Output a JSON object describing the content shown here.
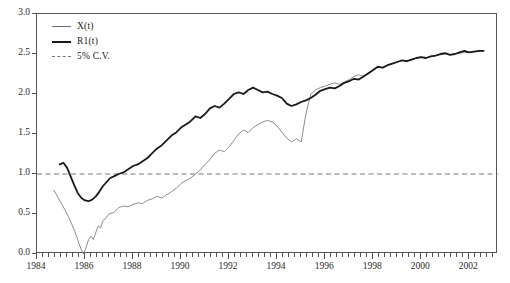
{
  "chart_data": {
    "type": "line",
    "title": "",
    "subtitle": "",
    "xlabel": "",
    "ylabel": "",
    "xlim": [
      1984.0,
      2003.2
    ],
    "ylim": [
      0.0,
      3.0
    ],
    "grid": false,
    "legend_position": "top-left",
    "x_ticks": [
      "1984",
      "1986",
      "1988",
      "1990",
      "1992",
      "1994",
      "1996",
      "1998",
      "2000",
      "2002"
    ],
    "x_tick_values": [
      1984,
      1986,
      1988,
      1990,
      1992,
      1994,
      1996,
      1998,
      2000,
      2002
    ],
    "x_minor_step": 0.25,
    "y_ticks": [
      "0.0",
      "0.5",
      "1.0",
      "1.5",
      "2.0",
      "2.5",
      "3.0"
    ],
    "y_tick_values": [
      0.0,
      0.5,
      1.0,
      1.5,
      2.0,
      2.5,
      3.0
    ],
    "colors": {
      "x_series": "#6e6e6e",
      "r1_series": "#1a1a1a",
      "critical_value": "#777777",
      "axis": "#555555",
      "background": "#ffffff"
    },
    "annotations": {
      "critical_value_level": 1.0
    },
    "series": [
      {
        "name": "X(t)",
        "style": "thin-solid",
        "color": "#6e6e6e",
        "linewidth": 0.8,
        "x": [
          1984.7,
          1984.85,
          1985.0,
          1985.15,
          1985.3,
          1985.45,
          1985.55,
          1985.65,
          1985.75,
          1985.85,
          1985.95,
          1986.05,
          1986.15,
          1986.25,
          1986.35,
          1986.45,
          1986.55,
          1986.65,
          1986.75,
          1986.85,
          1987.0,
          1987.2,
          1987.4,
          1987.6,
          1987.8,
          1988.0,
          1988.2,
          1988.4,
          1988.6,
          1988.8,
          1989.0,
          1989.2,
          1989.4,
          1989.6,
          1989.8,
          1990.0,
          1990.2,
          1990.4,
          1990.6,
          1990.8,
          1991.0,
          1991.2,
          1991.4,
          1991.6,
          1991.8,
          1992.0,
          1992.2,
          1992.4,
          1992.6,
          1992.8,
          1993.0,
          1993.2,
          1993.4,
          1993.6,
          1993.8,
          1994.0,
          1994.2,
          1994.4,
          1994.6,
          1994.8,
          1995.0,
          1995.2,
          1995.4,
          1995.6,
          1995.8,
          1996.0,
          1996.2,
          1996.4,
          1996.6,
          1996.8,
          1997.0,
          1997.2,
          1997.4,
          1997.6,
          1997.8,
          1998.0,
          1998.2,
          1998.4,
          1998.6,
          1998.8,
          1999.0,
          1999.2,
          1999.4,
          1999.6,
          1999.8,
          2000.0,
          2000.2,
          2000.4,
          2000.6,
          2000.8,
          2001.0,
          2001.2,
          2001.4,
          2001.6,
          2001.8,
          2002.0,
          2002.2,
          2002.4,
          2002.6
        ],
        "y": [
          0.8,
          0.72,
          0.64,
          0.56,
          0.47,
          0.37,
          0.3,
          0.22,
          0.13,
          0.05,
          0.0,
          0.09,
          0.18,
          0.22,
          0.18,
          0.27,
          0.35,
          0.33,
          0.42,
          0.44,
          0.5,
          0.52,
          0.58,
          0.6,
          0.59,
          0.62,
          0.64,
          0.63,
          0.67,
          0.69,
          0.72,
          0.7,
          0.74,
          0.78,
          0.82,
          0.88,
          0.92,
          0.95,
          1.0,
          1.05,
          1.12,
          1.18,
          1.26,
          1.3,
          1.28,
          1.34,
          1.42,
          1.5,
          1.55,
          1.52,
          1.58,
          1.62,
          1.65,
          1.67,
          1.65,
          1.6,
          1.52,
          1.45,
          1.4,
          1.44,
          1.4,
          1.75,
          2.0,
          2.05,
          2.08,
          2.1,
          2.12,
          2.14,
          2.12,
          2.15,
          2.18,
          2.22,
          2.24,
          2.22,
          2.25,
          2.3,
          2.35,
          2.33,
          2.36,
          2.38,
          2.4,
          2.42,
          2.41,
          2.43,
          2.45,
          2.46,
          2.45,
          2.47,
          2.48,
          2.49,
          2.5,
          2.49,
          2.5,
          2.51,
          2.52,
          2.52,
          2.53,
          2.53,
          2.54
        ]
      },
      {
        "name": "R1(t)",
        "style": "bold-solid",
        "color": "#1a1a1a",
        "linewidth": 1.8,
        "x": [
          1984.95,
          1985.1,
          1985.25,
          1985.4,
          1985.55,
          1985.7,
          1985.85,
          1986.0,
          1986.15,
          1986.3,
          1986.45,
          1986.6,
          1986.75,
          1986.9,
          1987.05,
          1987.2,
          1987.4,
          1987.6,
          1987.8,
          1988.0,
          1988.2,
          1988.4,
          1988.6,
          1988.8,
          1989.0,
          1989.2,
          1989.4,
          1989.6,
          1989.8,
          1990.0,
          1990.2,
          1990.4,
          1990.6,
          1990.8,
          1991.0,
          1991.2,
          1991.4,
          1991.6,
          1991.8,
          1992.0,
          1992.2,
          1992.4,
          1992.6,
          1992.8,
          1993.0,
          1993.2,
          1993.4,
          1993.6,
          1993.8,
          1994.0,
          1994.2,
          1994.4,
          1994.6,
          1994.8,
          1995.0,
          1995.2,
          1995.4,
          1995.6,
          1995.8,
          1996.0,
          1996.2,
          1996.4,
          1996.6,
          1996.8,
          1997.0,
          1997.2,
          1997.4,
          1997.6,
          1997.8,
          1998.0,
          1998.2,
          1998.4,
          1998.6,
          1998.8,
          1999.0,
          1999.2,
          1999.4,
          1999.6,
          1999.8,
          2000.0,
          2000.2,
          2000.4,
          2000.6,
          2000.8,
          2001.0,
          2001.2,
          2001.4,
          2001.6,
          2001.8,
          2002.0,
          2002.2,
          2002.4,
          2002.6
        ],
        "y": [
          1.12,
          1.14,
          1.08,
          0.97,
          0.86,
          0.76,
          0.7,
          0.67,
          0.66,
          0.68,
          0.72,
          0.78,
          0.85,
          0.9,
          0.95,
          0.97,
          1.0,
          1.02,
          1.06,
          1.1,
          1.12,
          1.16,
          1.2,
          1.26,
          1.32,
          1.36,
          1.42,
          1.48,
          1.52,
          1.58,
          1.62,
          1.66,
          1.72,
          1.7,
          1.75,
          1.82,
          1.85,
          1.83,
          1.88,
          1.94,
          2.0,
          2.02,
          2.0,
          2.05,
          2.08,
          2.05,
          2.02,
          2.03,
          2.0,
          1.98,
          1.95,
          1.88,
          1.85,
          1.87,
          1.9,
          1.92,
          1.95,
          1.99,
          2.04,
          2.06,
          2.08,
          2.07,
          2.1,
          2.14,
          2.16,
          2.19,
          2.18,
          2.22,
          2.26,
          2.3,
          2.34,
          2.33,
          2.36,
          2.38,
          2.4,
          2.42,
          2.41,
          2.43,
          2.45,
          2.46,
          2.45,
          2.47,
          2.48,
          2.5,
          2.51,
          2.49,
          2.5,
          2.52,
          2.54,
          2.52,
          2.53,
          2.54,
          2.54
        ]
      }
    ]
  },
  "legend": {
    "items": [
      {
        "label": "X(t)",
        "style": "thin"
      },
      {
        "label": "R1(t)",
        "style": "bold"
      },
      {
        "label": "5% C.V.",
        "style": "dash"
      }
    ]
  }
}
